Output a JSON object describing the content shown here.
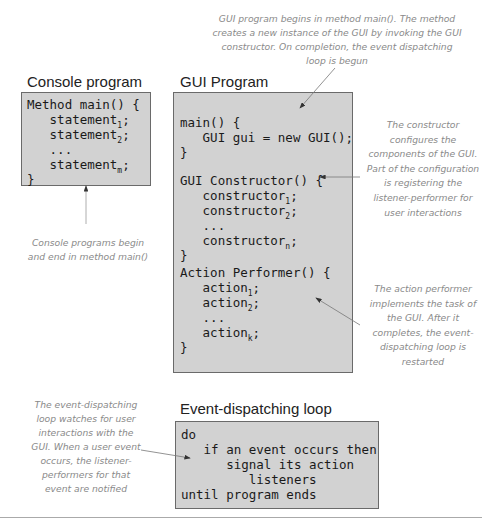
{
  "console": {
    "title": "Console program",
    "lines": [
      {
        "text": "Method main() {"
      },
      {
        "text": "   statement",
        "sub": "1",
        "tail": ";"
      },
      {
        "text": "   statement",
        "sub": "2",
        "tail": ";"
      },
      {
        "text": "   ..."
      },
      {
        "text": "   statement",
        "sub": "m",
        "tail": ";"
      },
      {
        "text": "}"
      }
    ],
    "note": "Console programs begin and end in method main()"
  },
  "gui": {
    "title": "GUI Program",
    "main_lines": [
      "main() {",
      "   GUI gui = new GUI();",
      "}"
    ],
    "constructor_lines": [
      {
        "text": "GUI Constructor() {"
      },
      {
        "text": "   constructor",
        "sub": "1",
        "tail": ";"
      },
      {
        "text": "   constructor",
        "sub": "2",
        "tail": ";"
      },
      {
        "text": "   ..."
      },
      {
        "text": "   constructor",
        "sub": "n",
        "tail": ";"
      },
      {
        "text": "}"
      }
    ],
    "performer_lines": [
      {
        "text": "Action Performer() {"
      },
      {
        "text": "   action",
        "sub": "1",
        "tail": ";"
      },
      {
        "text": "   action",
        "sub": "2",
        "tail": ";"
      },
      {
        "text": "   ..."
      },
      {
        "text": "   action",
        "sub": "k",
        "tail": ";"
      },
      {
        "text": "}"
      }
    ]
  },
  "event_loop": {
    "title": "Event-dispatching loop",
    "lines": [
      "do",
      "   if an event occurs then",
      "      signal its action",
      "         listeners",
      "until program ends"
    ]
  },
  "notes": {
    "top": "GUI program begins in method main(). The method creates a new instance of the  GUI by invoking the GUI constructor. On completion, the event dispatching loop is begun",
    "constructor": "The constructor configures the components of the GUI. Part of the configuration is registering  the listener-performer for user interactions",
    "performer": "The action performer implements the task of the GUI. After it completes, the event-dispatching loop is restarted",
    "event_loop": "The event-dispatching loop watches for user interactions with the GUI. When a user event occurs, the listener-performers for that event are notified"
  },
  "colors": {
    "box_fill": "#d2d2d2",
    "box_border": "#6a6a6a",
    "note_text": "#8a8a8a",
    "arrow": "#555555"
  }
}
